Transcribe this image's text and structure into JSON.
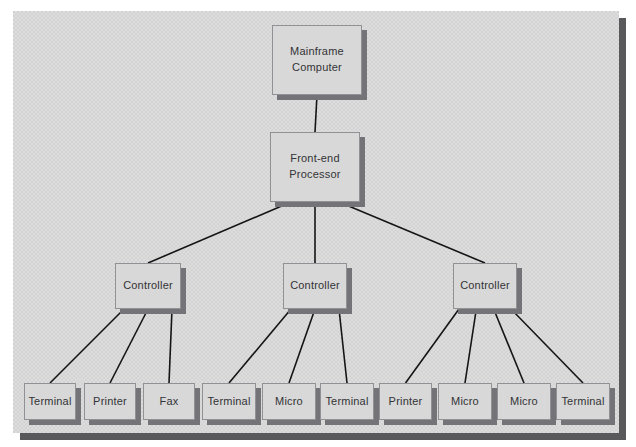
{
  "colors": {
    "page_background": "#ffffff",
    "panel_fill": "#d3d3d3",
    "panel_shadow": "#59595c",
    "box_fill": "#d8d8d8",
    "box_border": "#919195",
    "box_shadow": "#737378",
    "line": "#151515",
    "text": "#333336"
  },
  "diagram": {
    "type": "hierarchy-network-diagram",
    "nodes": [
      {
        "id": "mainframe",
        "label": "Mainframe\nComputer"
      },
      {
        "id": "fep",
        "label": "Front-end\nProcessor"
      },
      {
        "id": "ctrl1",
        "label": "Controller"
      },
      {
        "id": "ctrl2",
        "label": "Controller"
      },
      {
        "id": "ctrl3",
        "label": "Controller"
      },
      {
        "id": "t1",
        "label": "Terminal"
      },
      {
        "id": "p1",
        "label": "Printer"
      },
      {
        "id": "fax1",
        "label": "Fax"
      },
      {
        "id": "t2",
        "label": "Terminal"
      },
      {
        "id": "m1",
        "label": "Micro"
      },
      {
        "id": "t3",
        "label": "Terminal"
      },
      {
        "id": "p2",
        "label": "Printer"
      },
      {
        "id": "m2",
        "label": "Micro"
      },
      {
        "id": "m3",
        "label": "Micro"
      },
      {
        "id": "t4",
        "label": "Terminal"
      }
    ],
    "edges": [
      {
        "from": "mainframe",
        "to": "fep"
      },
      {
        "from": "fep",
        "to": "ctrl1"
      },
      {
        "from": "fep",
        "to": "ctrl2"
      },
      {
        "from": "fep",
        "to": "ctrl3"
      },
      {
        "from": "ctrl1",
        "to": "t1"
      },
      {
        "from": "ctrl1",
        "to": "p1"
      },
      {
        "from": "ctrl1",
        "to": "fax1"
      },
      {
        "from": "ctrl2",
        "to": "t2"
      },
      {
        "from": "ctrl2",
        "to": "m1"
      },
      {
        "from": "ctrl2",
        "to": "t3"
      },
      {
        "from": "ctrl3",
        "to": "p2"
      },
      {
        "from": "ctrl3",
        "to": "m2"
      },
      {
        "from": "ctrl3",
        "to": "m3"
      },
      {
        "from": "ctrl3",
        "to": "t4"
      }
    ]
  }
}
